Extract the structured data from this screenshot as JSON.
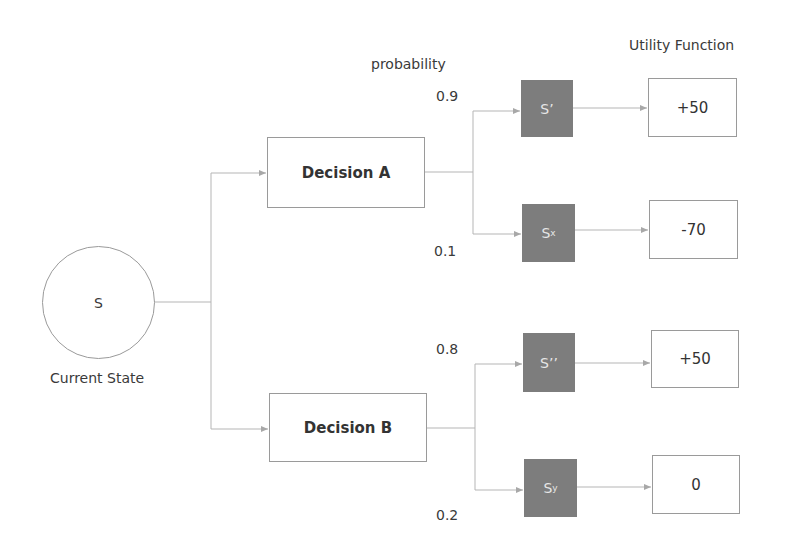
{
  "headers": {
    "probability": "probability",
    "utility": "Utility Function"
  },
  "current_state": {
    "symbol": "S",
    "caption": "Current State"
  },
  "decisions": [
    {
      "label": "Decision A",
      "outcomes": [
        {
          "probability": "0.9",
          "state": "S’",
          "state_sub": "",
          "utility": "+50"
        },
        {
          "probability": "0.1",
          "state": "S",
          "state_sub": "x",
          "utility": "-70"
        }
      ]
    },
    {
      "label": "Decision B",
      "outcomes": [
        {
          "probability": "0.8",
          "state": "S’’",
          "state_sub": "",
          "utility": "+50"
        },
        {
          "probability": "0.2",
          "state": "S",
          "state_sub": "y",
          "utility": "0"
        }
      ]
    }
  ],
  "colors": {
    "state_fill": "#7d7d7d",
    "line": "#b0b0b0",
    "border": "#9a9a9a"
  }
}
